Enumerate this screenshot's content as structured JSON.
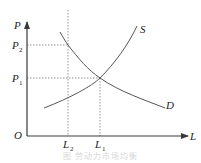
{
  "diagram": {
    "type": "supply-demand",
    "axes": {
      "y_label": "P",
      "x_label": "L",
      "origin_label": "O"
    },
    "price_levels": [
      {
        "id": "P2",
        "base": "P",
        "sub": "2"
      },
      {
        "id": "P1",
        "base": "P",
        "sub": "1"
      }
    ],
    "quantity_levels": [
      {
        "id": "L2",
        "base": "L",
        "sub": "2"
      },
      {
        "id": "L1",
        "base": "L",
        "sub": "1"
      }
    ],
    "curves": [
      {
        "id": "supply",
        "label": "S",
        "slope": "upward"
      },
      {
        "id": "demand",
        "label": "D",
        "slope": "downward"
      }
    ],
    "equilibrium": {
      "price": "P1",
      "quantity": "L1"
    },
    "reference_point": {
      "price": "P2",
      "quantity": "L2",
      "on_curve": "demand"
    },
    "caption": "图 劳动力市场均衡"
  },
  "colors": {
    "axis": "#3a3a3a",
    "curve": "#555555",
    "guide": "#777777",
    "text": "#222222",
    "caption": "#d8d8d8"
  }
}
